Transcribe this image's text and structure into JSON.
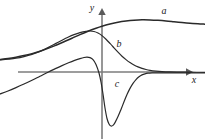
{
  "figure": {
    "background_color": "#ffffff",
    "width": 205,
    "height": 139
  },
  "axes": {
    "x_label": "x",
    "y_label": "y",
    "axis_color": "#7d7d7d",
    "x_axis_y_px": 72,
    "y_axis_x_px": 102,
    "x_axis_start_px": 18,
    "x_axis_end_px": 192,
    "y_axis_top_px": 8,
    "y_axis_bottom_px": 139,
    "x_label_pos": {
      "x": 194,
      "y": 81
    },
    "y_label_pos": {
      "x": 92,
      "y": 9
    }
  },
  "chart_data": {
    "type": "line",
    "title": "",
    "xlabel": "x",
    "ylabel": "y",
    "grid": false,
    "legend_position": "inline-annotations",
    "axis_origin_px": {
      "x": 102,
      "y": 72
    },
    "xlim_px": [
      0,
      205
    ],
    "ylim_px": [
      139,
      0
    ],
    "series": [
      {
        "name": "a",
        "label": "a",
        "color": "#2a2a2a",
        "stroke_width": 1.5,
        "description": "monotone rising sigmoid that levels off and gently declines at the right; the antiderivative-like curve",
        "label_pos_px": {
          "x": 164,
          "y": 12
        },
        "points_px": [
          [
            0,
            59.5
          ],
          [
            8,
            58.5
          ],
          [
            16,
            57.2
          ],
          [
            24,
            55.6
          ],
          [
            32,
            53.6
          ],
          [
            40,
            51.2
          ],
          [
            48,
            48.4
          ],
          [
            56,
            45.2
          ],
          [
            64,
            41.8
          ],
          [
            72,
            38.2
          ],
          [
            80,
            34.6
          ],
          [
            88,
            31.2
          ],
          [
            96,
            28.2
          ],
          [
            102,
            26.2
          ],
          [
            110,
            24.0
          ],
          [
            118,
            22.2
          ],
          [
            126,
            21.0
          ],
          [
            134,
            20.2
          ],
          [
            142,
            19.8
          ],
          [
            150,
            19.9
          ],
          [
            158,
            20.3
          ],
          [
            166,
            20.9
          ],
          [
            174,
            21.7
          ],
          [
            182,
            22.5
          ],
          [
            190,
            23.2
          ],
          [
            198,
            23.8
          ],
          [
            205,
            24.2
          ]
        ]
      },
      {
        "name": "b",
        "label": "b",
        "color": "#2a2a2a",
        "stroke_width": 1.2,
        "description": "bell-shaped hump peaking left of the y-axis, decaying toward the x-axis on both sides; the first-derivative-like curve",
        "label_pos_px": {
          "x": 119,
          "y": 45
        },
        "points_px": [
          [
            0,
            60.0
          ],
          [
            8,
            59.2
          ],
          [
            16,
            58.2
          ],
          [
            24,
            56.6
          ],
          [
            32,
            54.4
          ],
          [
            40,
            51.4
          ],
          [
            48,
            47.6
          ],
          [
            56,
            43.4
          ],
          [
            62,
            40.2
          ],
          [
            68,
            37.2
          ],
          [
            74,
            34.6
          ],
          [
            80,
            32.6
          ],
          [
            86,
            31.3
          ],
          [
            90,
            31.0
          ],
          [
            94,
            31.5
          ],
          [
            98,
            33.0
          ],
          [
            102,
            35.6
          ],
          [
            106,
            39.2
          ],
          [
            110,
            43.4
          ],
          [
            114,
            47.8
          ],
          [
            118,
            52.2
          ],
          [
            122,
            56.2
          ],
          [
            126,
            59.6
          ],
          [
            130,
            62.6
          ],
          [
            134,
            65.0
          ],
          [
            138,
            66.9
          ],
          [
            142,
            68.4
          ],
          [
            146,
            69.5
          ],
          [
            150,
            70.3
          ],
          [
            156,
            71.1
          ],
          [
            162,
            71.6
          ],
          [
            170,
            71.9
          ],
          [
            180,
            72.1
          ],
          [
            190,
            72.2
          ],
          [
            205,
            72.3
          ]
        ]
      },
      {
        "name": "c",
        "label": "c",
        "color": "#2a2a2a",
        "stroke_width": 1.2,
        "description": "rises from lower-left to a local maximum, plunges steeply to a deep minimum below the axis just right of the y-axis, then rises back to approach the axis from below; the second-derivative-like curve",
        "label_pos_px": {
          "x": 117,
          "y": 85
        },
        "points_px": [
          [
            0,
            94.0
          ],
          [
            8,
            91.0
          ],
          [
            16,
            87.6
          ],
          [
            24,
            84.0
          ],
          [
            32,
            80.2
          ],
          [
            40,
            76.2
          ],
          [
            48,
            72.2
          ],
          [
            56,
            68.4
          ],
          [
            62,
            65.6
          ],
          [
            68,
            63.0
          ],
          [
            74,
            60.6
          ],
          [
            80,
            58.6
          ],
          [
            84,
            57.5
          ],
          [
            87,
            57.1
          ],
          [
            90,
            57.6
          ],
          [
            93,
            59.6
          ],
          [
            96,
            64.4
          ],
          [
            99,
            73.0
          ],
          [
            101,
            82.0
          ],
          [
            103,
            94.0
          ],
          [
            105,
            108.0
          ],
          [
            107,
            118.5
          ],
          [
            109,
            124.0
          ],
          [
            111,
            126.0
          ],
          [
            113,
            125.4
          ],
          [
            115,
            122.6
          ],
          [
            118,
            116.6
          ],
          [
            121,
            109.4
          ],
          [
            124,
            101.8
          ],
          [
            127,
            94.6
          ],
          [
            130,
            88.4
          ],
          [
            133,
            83.4
          ],
          [
            136,
            79.6
          ],
          [
            139,
            76.8
          ],
          [
            142,
            74.9
          ],
          [
            145,
            73.8
          ],
          [
            148,
            73.2
          ],
          [
            152,
            72.9
          ],
          [
            158,
            72.8
          ],
          [
            166,
            72.8
          ],
          [
            176,
            72.8
          ],
          [
            190,
            72.9
          ],
          [
            205,
            73.0
          ]
        ]
      }
    ]
  }
}
